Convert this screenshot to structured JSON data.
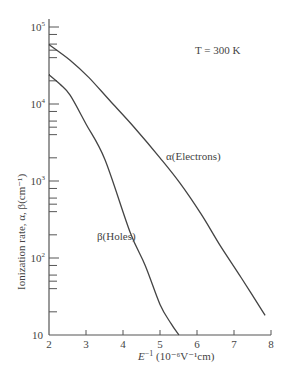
{
  "chart_data": {
    "type": "line",
    "title": "",
    "annotation": "T = 300 K",
    "xlabel": "E⁻¹ (10⁻⁶V⁻¹cm)",
    "ylabel": "Ionization rate, α, β(cm⁻¹)",
    "xscale": "linear",
    "yscale": "log",
    "xlim": [
      2,
      8
    ],
    "ylim": [
      10,
      100000
    ],
    "x_ticks": [
      "2",
      "3",
      "4",
      "5",
      "6",
      "7",
      "8"
    ],
    "y_ticks": [
      "10",
      "10²",
      "10³",
      "10⁴",
      "10⁵"
    ],
    "grid": false,
    "legend": "inline labels",
    "series": [
      {
        "name": "α(Electrons)",
        "x": [
          2.0,
          2.57,
          3.08,
          3.65,
          4.3,
          5.0,
          5.54,
          6.1,
          6.62,
          7.2,
          7.84
        ],
        "y": [
          59000,
          37000,
          22000,
          11000,
          5000,
          2000,
          940,
          380,
          147,
          55,
          18
        ]
      },
      {
        "name": "β(Holes)",
        "x": [
          2.0,
          2.3,
          2.57,
          3.0,
          3.51,
          4.19,
          4.6,
          5.0,
          5.3,
          5.51
        ],
        "y": [
          24000,
          18000,
          13000,
          5500,
          1900,
          218,
          80,
          25,
          14,
          10
        ]
      }
    ]
  },
  "labels": {
    "temperature": "T = 300 K",
    "alpha_curve": "α(Electrons)",
    "beta_curve": "β(Holes)",
    "x_axis_prefix": "E",
    "x_axis_exp": "−1",
    "x_axis_unit": " (10⁻⁶V⁻¹cm)",
    "y_axis": "Ionization rate, α, β(cm⁻¹)"
  }
}
